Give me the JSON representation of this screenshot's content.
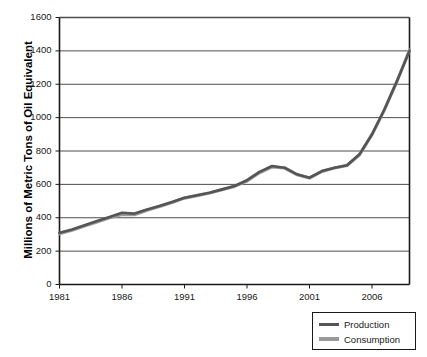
{
  "chart_data": {
    "type": "line",
    "title": "",
    "xlabel": "",
    "ylabel": "Millions of Metric Tons of Oil Equivalent",
    "xlim": [
      1981,
      2009
    ],
    "ylim": [
      0,
      1600
    ],
    "grid": true,
    "legend_position": "bottom-right",
    "y_ticks": [
      0,
      200,
      400,
      600,
      800,
      1000,
      1200,
      1400,
      1600
    ],
    "x_ticks": [
      1981,
      1986,
      1991,
      1996,
      2001,
      2006
    ],
    "x": [
      1981,
      1982,
      1983,
      1984,
      1985,
      1986,
      1987,
      1988,
      1989,
      1990,
      1991,
      1992,
      1993,
      1994,
      1995,
      1996,
      1997,
      1998,
      1999,
      2000,
      2001,
      2002,
      2003,
      2004,
      2005,
      2006,
      2007,
      2008,
      2009
    ],
    "series": [
      {
        "name": "Production",
        "color": "#555555",
        "values": [
          310,
          330,
          355,
          380,
          405,
          430,
          425,
          450,
          470,
          495,
          520,
          535,
          550,
          570,
          590,
          625,
          675,
          710,
          700,
          660,
          640,
          680,
          700,
          715,
          780,
          900,
          1050,
          1220,
          1400
        ]
      },
      {
        "name": "Consumption",
        "color": "#9a9a9a",
        "values": [
          305,
          325,
          350,
          375,
          400,
          420,
          418,
          445,
          468,
          492,
          518,
          533,
          548,
          568,
          588,
          620,
          670,
          705,
          698,
          658,
          638,
          678,
          698,
          713,
          778,
          898,
          1048,
          1218,
          1405
        ]
      }
    ]
  },
  "legend": {
    "items": [
      {
        "label": "Production"
      },
      {
        "label": "Consumption"
      }
    ]
  }
}
